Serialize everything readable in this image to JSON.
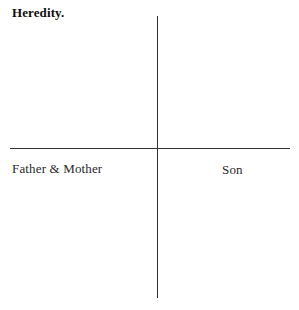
{
  "figure": {
    "title": "Heredity.",
    "background_color": "#ffffff",
    "ink_color": "#2b2b2b"
  },
  "axes": {
    "vertical_line_name": "vertical-axis-line",
    "horizontal_line_name": "horizontal-axis-line",
    "labels": {
      "left": "Father & Mother",
      "right": "Son"
    }
  },
  "chart_data": {
    "type": "scatter",
    "title": "Heredity.",
    "subtitle": "",
    "xlabel": "",
    "ylabel": "",
    "annotations": [
      {
        "text": "Father & Mother",
        "position": "lower-left-quadrant"
      },
      {
        "text": "Son",
        "position": "lower-right-quadrant"
      }
    ],
    "grid": false,
    "legend": false,
    "legend_position": "none",
    "x": [],
    "y": [],
    "series": [],
    "xlim": [
      -1,
      1
    ],
    "ylim": [
      -1,
      1
    ],
    "xticks": [],
    "yticks": [],
    "xticklabels": [],
    "yticklabels": []
  }
}
